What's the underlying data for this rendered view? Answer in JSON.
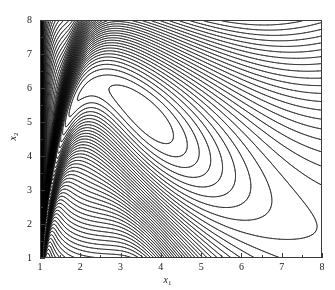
{
  "chart_data": {
    "type": "line",
    "subtype": "contour",
    "title": "",
    "xlabel": "x1",
    "ylabel": "x2",
    "xlim": [
      1,
      8
    ],
    "ylim": [
      1,
      8
    ],
    "xticks": [
      1,
      2,
      3,
      4,
      5,
      6,
      7,
      8
    ],
    "yticks": [
      1,
      2,
      3,
      4,
      5,
      6,
      7,
      8
    ],
    "xtick_labels": [
      "1",
      "2",
      "3",
      "4",
      "5",
      "6",
      "7",
      "8"
    ],
    "ytick_labels": [
      "1",
      "2",
      "3",
      "4",
      "5",
      "6",
      "7",
      "8"
    ],
    "minor_ticks": true,
    "grid": false,
    "legend": null,
    "line_color": "#000000",
    "background": "#ffffff",
    "n_levels": 60,
    "peak": [
      2.1,
      8.0
    ],
    "mode_center": [
      2.7,
      4.7
    ],
    "ridge_points": [
      [
        1.0,
        1.0
      ],
      [
        1.3,
        3.2
      ],
      [
        1.6,
        5.2
      ],
      [
        1.9,
        7.0
      ],
      [
        2.1,
        8.0
      ],
      [
        2.6,
        7.6
      ],
      [
        3.2,
        6.9
      ],
      [
        4.0,
        6.2
      ],
      [
        5.0,
        5.5
      ],
      [
        6.0,
        5.0
      ],
      [
        7.0,
        4.6
      ],
      [
        8.0,
        4.3
      ]
    ],
    "levels": [
      0.02,
      0.05,
      0.08,
      0.12,
      0.16,
      0.2,
      0.25,
      0.3,
      0.35,
      0.4,
      0.45,
      0.5,
      0.55,
      0.6,
      0.65,
      0.7,
      0.75,
      0.8,
      0.85,
      0.9,
      0.95,
      1.0,
      1.05,
      1.1,
      1.15,
      1.2,
      1.25,
      1.3,
      1.35,
      1.4,
      1.45,
      1.5,
      1.55,
      1.6,
      1.65,
      1.7,
      1.75,
      1.8,
      1.85,
      1.9,
      1.95,
      2.0,
      2.05,
      2.1,
      2.15,
      2.2,
      2.25,
      2.3,
      2.35,
      2.4,
      2.45,
      2.5,
      2.55,
      2.6,
      2.65,
      2.7,
      2.75,
      2.8,
      2.85,
      2.9
    ]
  },
  "axes": {
    "x_title": "x",
    "x_sub": "1",
    "y_title": "x",
    "y_sub": "2"
  }
}
